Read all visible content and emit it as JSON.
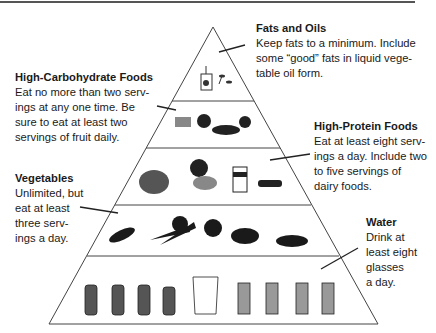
{
  "tiers": [
    {
      "name": "Fats and Oils",
      "desc": "Keep fats to a minimum. Include\nsome “good” fats in liquid vege-\ntable oil form.",
      "items": [
        "oil-bottle",
        "spoons"
      ]
    },
    {
      "name": "High-Carbohydrate Foods",
      "desc": "Eat no more than two serv-\nings at any one time. Be\nsure to eat at least two\nservings of fruit daily.",
      "items": [
        "bread",
        "fruit-bowl",
        "pasta",
        "berries"
      ]
    },
    {
      "name": "High-Protein Foods",
      "desc": "Eat at least eight serv-\nings a day. Include two\nto five servings of\ndairy foods.",
      "items": [
        "cheese-plate",
        "fish-chicken",
        "milk-carton",
        "beans"
      ]
    },
    {
      "name": "Vegetables",
      "desc": "Unlimited, but\neat at least\nthree serv-\nings a day.",
      "items": [
        "greens",
        "carrots",
        "broccoli",
        "peppers",
        "squash"
      ]
    },
    {
      "name": "Water",
      "desc": "Drink at\nleast eight\nglasses\na day.",
      "items": [
        "bottle",
        "bottle",
        "bottle",
        "bottle",
        "pitcher",
        "glass",
        "glass",
        "glass",
        "glass"
      ]
    }
  ]
}
